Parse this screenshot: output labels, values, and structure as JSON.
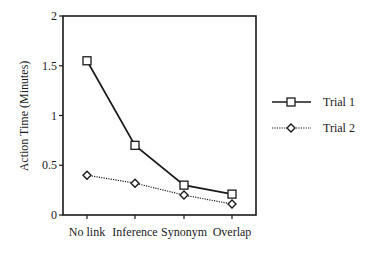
{
  "chart_data": {
    "type": "line",
    "title": "",
    "xlabel": "",
    "ylabel": "Action Time (Minutes)",
    "categories": [
      "No link",
      "Inference",
      "Synonym",
      "Overlap"
    ],
    "series": [
      {
        "name": "Trial 1",
        "values": [
          1.55,
          0.7,
          0.3,
          0.21
        ],
        "line_style": "solid",
        "marker": "square",
        "color": "#1a1a1a"
      },
      {
        "name": "Trial 2",
        "values": [
          0.4,
          0.32,
          0.2,
          0.11
        ],
        "line_style": "dotted",
        "marker": "diamond",
        "color": "#1a1a1a"
      }
    ],
    "ylim": [
      0,
      2
    ],
    "yticks": [
      0,
      0.5,
      1,
      1.5,
      2
    ],
    "ytick_labels": [
      "0",
      "0.5",
      "1",
      "1.5",
      "2"
    ],
    "grid": false,
    "legend_position": "right"
  },
  "legend": {
    "items": [
      {
        "label": "Trial 1"
      },
      {
        "label": "Trial 2"
      }
    ]
  }
}
